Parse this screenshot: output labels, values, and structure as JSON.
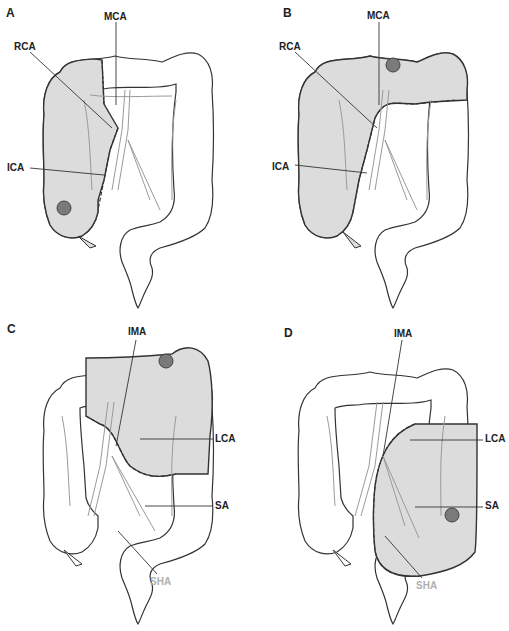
{
  "figure": {
    "colors": {
      "resected_fill": "#dcdcdc",
      "outline": "#333333",
      "vessel": "#9a9a9a",
      "tumor_fill": "#7a7a7a",
      "tumor_stroke": "#444444",
      "grey_label": "#b0b0b0"
    },
    "panels": [
      {
        "letter": "A",
        "labels": {
          "l1": "MCA",
          "l2": "RCA",
          "l3": "ICA"
        },
        "resected_region": "right colon (cecum, ascending colon, hepatic flexure)",
        "tumor_location": "cecum"
      },
      {
        "letter": "B",
        "labels": {
          "l1": "MCA",
          "l2": "RCA",
          "l3": "ICA"
        },
        "resected_region": "right colon and transverse colon (extended right hemicolectomy)",
        "tumor_location": "transverse colon"
      },
      {
        "letter": "C",
        "labels": {
          "l1": "IMA",
          "l2": "LCA",
          "l3": "SA",
          "l4": "SHA"
        },
        "resected_region": "distal transverse colon, splenic flexure, descending colon",
        "tumor_location": "splenic flexure"
      },
      {
        "letter": "D",
        "labels": {
          "l1": "IMA",
          "l2": "LCA",
          "l3": "SA",
          "l4": "SHA"
        },
        "resected_region": "descending and sigmoid colon",
        "tumor_location": "descending colon"
      }
    ]
  }
}
